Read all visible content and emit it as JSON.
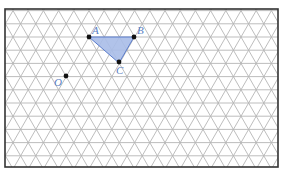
{
  "figure": {
    "type": "isometric-grid-diagram",
    "grid": {
      "line_color": "#b5b5b5",
      "row_spacing": 13.2,
      "side_length": 15.2,
      "frame_color": "#333333"
    },
    "shape": {
      "name": "triangle ABC",
      "fill": "#a8bde8",
      "stroke": "#4a6fc0",
      "vertices": [
        "A",
        "B",
        "C"
      ]
    },
    "points": [
      {
        "label": "A",
        "x": 89,
        "y": 37
      },
      {
        "label": "B",
        "x": 134,
        "y": 37
      },
      {
        "label": "C",
        "x": 119,
        "y": 63
      },
      {
        "label": "O",
        "x": 66,
        "y": 76
      }
    ],
    "labels": {
      "A": "A",
      "B": "B",
      "C": "C",
      "O": "O"
    },
    "colors": {
      "label": "#5b7fc4",
      "point": "#111111"
    }
  }
}
